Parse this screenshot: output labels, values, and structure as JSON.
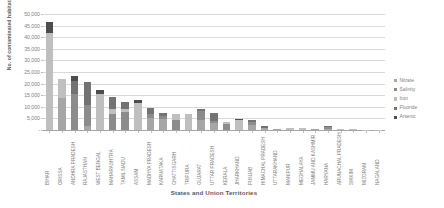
{
  "chart_data": {
    "type": "bar",
    "subtype": "stacked-column",
    "title": "",
    "xlabel": "States and Union Territories",
    "ylabel": "No. of contaminated habitations",
    "ylim": [
      0,
      50000
    ],
    "ytick_values": [
      0,
      5000,
      10000,
      15000,
      20000,
      25000,
      30000,
      35000,
      40000,
      45000,
      50000
    ],
    "ytick_labels": [
      "-",
      "5,000",
      "10,000",
      "15,000",
      "20,000",
      "25,000",
      "30,000",
      "35,000",
      "40,000",
      "45,000",
      "50,000"
    ],
    "grid": true,
    "legend_position": "right",
    "categories": [
      "BIHAR",
      "ORISSA",
      "ANDHRA PRADESH",
      "RAJASTHAN",
      "WEST BENGAL",
      "MAHARASHTRA",
      "TAMIL NADU",
      "ASSAM",
      "MADHYA PRADESH",
      "KARNATAKA",
      "CHATTISGARH",
      "TRIPURA",
      "GUJARAT",
      "UTTAR PRADESH",
      "KERALA",
      "JHARKHAND",
      "PUNJAB",
      "HIMACHAL PRADESH",
      "UTTARAKHAND",
      "MANIPUR",
      "MEGHALAYA",
      "JAMMU AND KASHMIR",
      "HARYANA",
      "ARUNACHAL PRADESH",
      "SIKKIM",
      "MIZORAM",
      "NAGALAND"
    ],
    "series": [
      {
        "name": "Nitrate",
        "color": "#a6a6a6",
        "values": [
          0,
          13800,
          0,
          1800,
          0,
          0,
          0,
          0,
          5300,
          4800,
          0,
          0,
          4500,
          3200,
          0,
          0,
          2200,
          900,
          500,
          0,
          0,
          300,
          600,
          0,
          0,
          0,
          0
        ]
      },
      {
        "name": "Salinity",
        "color": "#8c8c8c",
        "values": [
          0,
          0,
          15500,
          8800,
          0,
          6700,
          7600,
          0,
          1700,
          1200,
          4300,
          0,
          3600,
          900,
          2700,
          0,
          1300,
          0,
          0,
          0,
          0,
          0,
          700,
          0,
          0,
          0,
          0
        ]
      },
      {
        "name": "Iron",
        "color": "#bfbfbf",
        "values": [
          42000,
          8000,
          0,
          0,
          15400,
          2500,
          1400,
          11600,
          0,
          0,
          2800,
          6800,
          0,
          0,
          900,
          4300,
          0,
          0,
          0,
          900,
          700,
          0,
          0,
          500,
          300,
          200,
          200
        ]
      },
      {
        "name": "Fluoride",
        "color": "#737373",
        "values": [
          0,
          0,
          5500,
          10300,
          0,
          4900,
          2900,
          0,
          2400,
          1500,
          0,
          0,
          1100,
          3400,
          0,
          0,
          900,
          700,
          0,
          0,
          0,
          0,
          400,
          0,
          0,
          0,
          0
        ]
      },
      {
        "name": "Arsenic",
        "color": "#4d4d4d",
        "values": [
          4500,
          0,
          2100,
          0,
          1900,
          0,
          0,
          1300,
          0,
          0,
          0,
          0,
          0,
          0,
          0,
          600,
          0,
          0,
          0,
          0,
          0,
          0,
          0,
          0,
          0,
          0,
          0
        ]
      }
    ],
    "totals": [
      46500,
      21800,
      23100,
      20900,
      17300,
      14100,
      11900,
      12900,
      9400,
      7500,
      7100,
      6800,
      9200,
      7500,
      3600,
      4900,
      4400,
      1600,
      500,
      900,
      700,
      300,
      1700,
      500,
      300,
      200,
      200
    ]
  }
}
